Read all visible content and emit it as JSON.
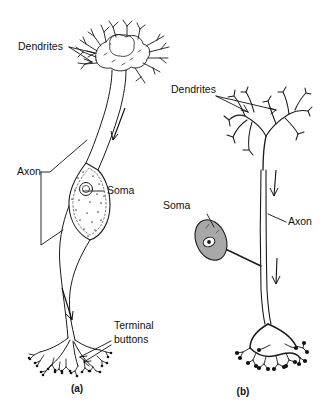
{
  "figure": {
    "background_color": "#ffffff",
    "ink_color": "#1a1a1a",
    "soma_fill_color": "#a8a8a8"
  },
  "panel_a": {
    "caption": "(a)",
    "labels": {
      "dendrites": "Dendrites",
      "axon": "Axon",
      "soma": "Soma",
      "terminal_buttons_line1": "Terminal",
      "terminal_buttons_line2": "buttons"
    }
  },
  "panel_b": {
    "caption": "(b)",
    "labels": {
      "dendrites": "Dendrites",
      "soma": "Soma",
      "axon": "Axon"
    }
  },
  "annotations": {
    "flow_arrows": 4,
    "arrow_meaning": "direction of signal conduction"
  }
}
